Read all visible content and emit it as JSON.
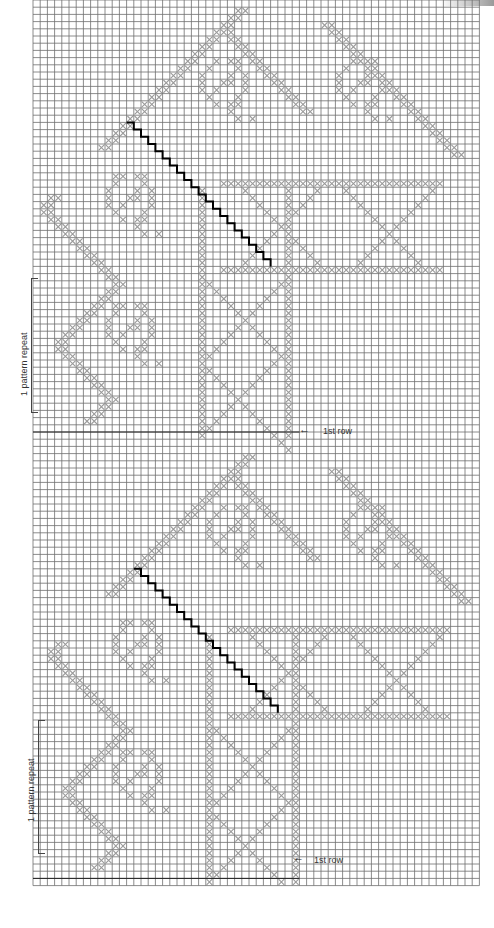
{
  "chart": {
    "type": "filet-crochet-chart",
    "grid": {
      "x0": 33,
      "y0": 0,
      "cell": 7.2,
      "cols": 62,
      "rows": 123,
      "line_color": "#6f6f6f",
      "cross_color": "#9a9a9a",
      "stitch_line_color": "#000000"
    }
  },
  "panels": [
    {
      "name": "top-panel",
      "row_offset": 0,
      "col_offset": 0,
      "repeat_label": "1 pattern repeat",
      "first_row_label": "1st row",
      "first_row_arrow": "←"
    },
    {
      "name": "bottom-panel",
      "row_offset": 62,
      "col_offset": 1,
      "repeat_label": "1 pattern repeat",
      "first_row_label": "1st row",
      "first_row_arrow": "←"
    }
  ],
  "motif": {
    "outline_steps": [
      [
        1,
        28
      ],
      [
        2,
        27
      ],
      [
        3,
        26
      ],
      [
        4,
        25
      ],
      [
        5,
        24
      ],
      [
        6,
        23
      ],
      [
        7,
        22
      ],
      [
        8,
        21
      ],
      [
        9,
        20
      ],
      [
        10,
        19
      ],
      [
        11,
        18
      ],
      [
        12,
        17
      ],
      [
        13,
        16
      ],
      [
        14,
        15
      ],
      [
        15,
        14
      ],
      [
        16,
        13
      ],
      [
        17,
        12
      ],
      [
        18,
        11
      ],
      [
        19,
        10
      ],
      [
        20,
        9
      ],
      [
        21,
        9
      ],
      [
        22,
        10
      ],
      [
        23,
        11
      ],
      [
        24,
        12
      ],
      [
        25,
        13
      ],
      [
        26,
        14
      ],
      [
        27,
        15
      ],
      [
        28,
        16
      ],
      [
        29,
        17
      ],
      [
        30,
        18
      ],
      [
        31,
        19
      ],
      [
        32,
        20
      ],
      [
        33,
        21
      ],
      [
        34,
        22
      ],
      [
        35,
        23
      ],
      [
        36,
        24
      ],
      [
        37,
        25
      ],
      [
        38,
        26
      ],
      [
        39,
        27
      ],
      [
        40,
        28
      ],
      [
        41,
        29
      ],
      [
        42,
        30
      ],
      [
        43,
        31
      ],
      [
        44,
        32
      ],
      [
        45,
        33
      ],
      [
        46,
        34
      ],
      [
        47,
        35
      ],
      [
        48,
        36
      ],
      [
        49,
        37
      ],
      [
        50,
        38
      ]
    ],
    "left_edge": [
      [
        27,
        2
      ],
      [
        28,
        1
      ],
      [
        29,
        1
      ],
      [
        30,
        2
      ],
      [
        31,
        3
      ],
      [
        32,
        4
      ],
      [
        33,
        5
      ],
      [
        34,
        6
      ],
      [
        35,
        7
      ],
      [
        36,
        8
      ],
      [
        37,
        9
      ],
      [
        38,
        10
      ],
      [
        39,
        11
      ],
      [
        40,
        10
      ],
      [
        41,
        9
      ],
      [
        42,
        8
      ],
      [
        43,
        7
      ],
      [
        44,
        6
      ],
      [
        45,
        5
      ],
      [
        46,
        4
      ],
      [
        47,
        3
      ],
      [
        48,
        3
      ],
      [
        49,
        4
      ],
      [
        50,
        5
      ],
      [
        51,
        6
      ],
      [
        52,
        7
      ],
      [
        53,
        8
      ],
      [
        54,
        9
      ],
      [
        55,
        10
      ],
      [
        56,
        9
      ],
      [
        57,
        8
      ],
      [
        58,
        7
      ]
    ],
    "right_edge": [
      [
        4,
        26
      ],
      [
        5,
        27
      ],
      [
        6,
        28
      ],
      [
        7,
        29
      ],
      [
        8,
        30
      ],
      [
        9,
        31
      ],
      [
        10,
        32
      ],
      [
        11,
        33
      ],
      [
        12,
        34
      ],
      [
        13,
        35
      ],
      [
        14,
        36
      ],
      [
        15,
        37
      ],
      [
        3,
        40
      ],
      [
        4,
        41
      ],
      [
        5,
        42
      ],
      [
        6,
        43
      ],
      [
        7,
        44
      ],
      [
        8,
        45
      ],
      [
        9,
        46
      ],
      [
        10,
        47
      ],
      [
        11,
        48
      ],
      [
        12,
        49
      ],
      [
        13,
        50
      ],
      [
        14,
        51
      ],
      [
        15,
        52
      ],
      [
        16,
        53
      ],
      [
        17,
        54
      ],
      [
        18,
        55
      ],
      [
        19,
        56
      ],
      [
        20,
        57
      ],
      [
        21,
        58
      ]
    ],
    "roses": [
      {
        "r": 11,
        "c": 26,
        "rad": 3
      },
      {
        "r": 11,
        "c": 45,
        "rad": 3
      },
      {
        "r": 27,
        "c": 13,
        "rad": 3
      },
      {
        "r": 45,
        "c": 13,
        "rad": 3
      }
    ],
    "band_rows": [
      25,
      37
    ],
    "band_cols": [
      26,
      56
    ],
    "lattice_col_band": [
      23,
      35
    ],
    "lattice_rows": [
      26,
      60
    ],
    "stitch_diagonal": {
      "start": [
        17,
        13
      ],
      "end": [
        37,
        35
      ]
    }
  },
  "labels": {
    "top_repeat": "1 pattern repeat",
    "top_first_row": "1st row",
    "bottom_repeat": "1 pattern repeat",
    "bottom_first_row": "1st row"
  }
}
